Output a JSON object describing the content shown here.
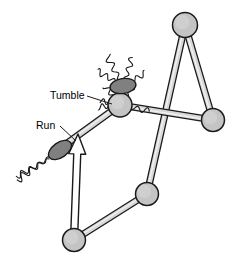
{
  "figure": {
    "background_color": "#ffffff",
    "width": 233,
    "height": 267,
    "labels": [
      {
        "id": "tumble",
        "text": "Tumble",
        "x": 50,
        "y": 99,
        "anchor": "start",
        "font_size": 10.5
      },
      {
        "id": "run",
        "text": "Run",
        "x": 36,
        "y": 129,
        "anchor": "start",
        "font_size": 10.5
      }
    ],
    "leader_lines": [
      {
        "id": "tumble-leader",
        "from": [
          87,
          96
        ],
        "to": [
          112,
          104
        ]
      },
      {
        "id": "run-leader",
        "from": [
          60,
          126
        ],
        "to": [
          76,
          141
        ]
      }
    ],
    "colors": {
      "node_fill": "#c4c4c4",
      "rod_fill": "#d8d8d8",
      "rod_highlight": "#f2f2f2",
      "bacterium_fill": "#808080",
      "outline": "#1a1a1a",
      "arrow_fill": "#ffffff",
      "flagellum_stroke": "#1a1a1a",
      "label_color": "#000000"
    },
    "nodes": [
      {
        "id": "node-apex",
        "name": "trajectory-node-apex",
        "x": 185,
        "y": 25,
        "r": 12.5
      },
      {
        "id": "node-right",
        "name": "trajectory-node-right",
        "x": 213,
        "y": 120,
        "r": 11.5
      },
      {
        "id": "node-tumble",
        "name": "trajectory-node-tumble",
        "x": 120,
        "y": 105,
        "r": 12.0
      },
      {
        "id": "node-lower-right",
        "name": "trajectory-node-lower-right",
        "x": 147,
        "y": 194,
        "r": 11.5
      },
      {
        "id": "node-bottom",
        "name": "trajectory-node-bottom",
        "x": 74,
        "y": 240,
        "r": 11.5
      }
    ],
    "rods": [
      {
        "id": "rod-apex-to-lower-right",
        "name": "trajectory-rod-apex-lower-right",
        "from": [
          185,
          25
        ],
        "to": [
          147,
          194
        ],
        "width": 6
      },
      {
        "id": "rod-apex-to-right",
        "name": "trajectory-rod-apex-right",
        "from": [
          185,
          25
        ],
        "to": [
          213,
          120
        ],
        "width": 6
      },
      {
        "id": "rod-tumble-to-right",
        "name": "trajectory-rod-tumble-right",
        "from": [
          120,
          105
        ],
        "to": [
          213,
          120
        ],
        "width": 6
      },
      {
        "id": "rod-lower-right-to-bottom",
        "name": "trajectory-rod-lower-right-bottom",
        "from": [
          147,
          194
        ],
        "to": [
          74,
          240
        ],
        "width": 6
      },
      {
        "id": "rod-run-segment",
        "name": "trajectory-rod-run-segment",
        "from": [
          120,
          105
        ],
        "to": [
          55,
          152
        ],
        "width": 6
      }
    ],
    "arrow": {
      "id": "run-direction-arrow",
      "name": "run-direction-arrow",
      "from": [
        74,
        240
      ],
      "to": [
        78,
        134
      ],
      "shaft_width": 7,
      "head_width": 17,
      "head_length": 20,
      "fill": "#ffffff"
    },
    "bacteria": [
      {
        "id": "bacterium-run",
        "name": "bacterium-run-state",
        "cx": 60,
        "cy": 150,
        "rx": 13,
        "ry": 7.5,
        "rotation": -35,
        "state": "run",
        "flagella_count": 1,
        "description": "single bundled helical flagellum trailing behind"
      },
      {
        "id": "bacterium-tumble",
        "name": "bacterium-tumble-state",
        "cx": 123,
        "cy": 86,
        "rx": 13,
        "ry": 7.5,
        "rotation": -8,
        "state": "tumble",
        "flagella_count": 5,
        "description": "flagella splayed apart in all directions"
      }
    ]
  }
}
